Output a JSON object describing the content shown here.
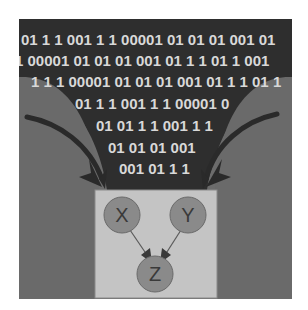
{
  "figure": {
    "binary_lines": [
      "01 1 1 001 1 1 00001 01 01 01 001 01",
      "1 00001 01 01 01 001 01 1 1 01 1 001",
      "1 1 1 00001 01 01 01 001 01 1 1 01 1",
      "01 1 1 001 1 1 00001 0",
      "01 01 1 1 001 1 1",
      "01 01 01 001",
      "001 01 1 1"
    ],
    "nodes": [
      {
        "id": "X",
        "label": "X"
      },
      {
        "id": "Y",
        "label": "Y"
      },
      {
        "id": "Z",
        "label": "Z"
      }
    ],
    "edges": [
      {
        "from": "X",
        "to": "Z"
      },
      {
        "from": "Y",
        "to": "Z"
      }
    ],
    "colors": {
      "dark_panel": "#2e2e2e",
      "binary_text": "#d8d8d8",
      "side_arc": "#6e6e6e",
      "arrow": "#2a2a2a",
      "box": "#c4c4c4",
      "node_fill": "#8a8a8a",
      "node_stroke": "#6a6a6a"
    }
  }
}
